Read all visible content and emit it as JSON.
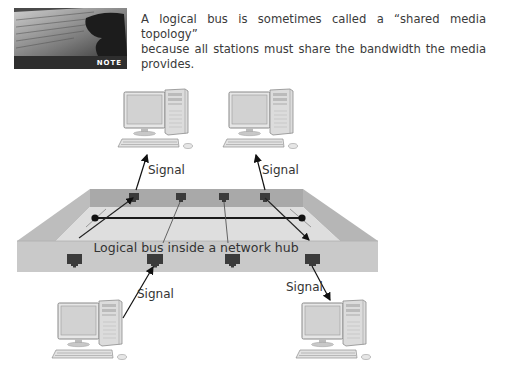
{
  "note": {
    "badge_label": "NOTE",
    "text_line1": "A logical bus is sometimes called a “shared media topology”",
    "text_line2": "because all stations must share the bandwidth the media provides."
  },
  "diagram": {
    "hub_label": "Logical bus inside a network hub",
    "signal_labels": [
      "Signal",
      "Signal",
      "Signal",
      "Signal"
    ],
    "computers": [
      {
        "position": "top-left"
      },
      {
        "position": "top-right"
      },
      {
        "position": "bottom-left"
      },
      {
        "position": "bottom-right"
      }
    ],
    "colors": {
      "hub_front": "#c9c9c9",
      "hub_back_wall": "#a9a9a9",
      "hub_floor": "#dedede",
      "port": "#3b3b3b",
      "bus_line": "#1a1a1a"
    }
  }
}
